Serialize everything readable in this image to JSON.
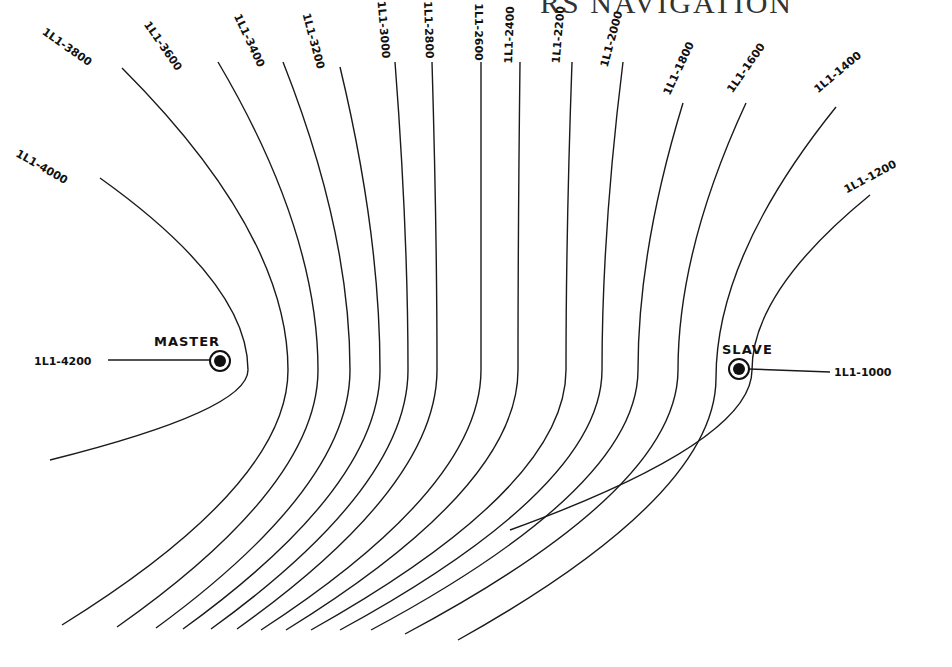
{
  "header": {
    "title": "RS NAVIGATION"
  },
  "stations": {
    "master": {
      "name": "MASTER",
      "line_label": "1L1-4200"
    },
    "slave": {
      "name": "SLAVE",
      "line_label": "1L1-1000"
    }
  },
  "lines_of_position": [
    {
      "label": "1L1-4000"
    },
    {
      "label": "1L1-3800"
    },
    {
      "label": "1L1-3600"
    },
    {
      "label": "1L1-3400"
    },
    {
      "label": "1L1-3200"
    },
    {
      "label": "1L1-3000"
    },
    {
      "label": "1L1-2800"
    },
    {
      "label": "1L1-2600"
    },
    {
      "label": "1L1-2400"
    },
    {
      "label": "1L1-2200"
    },
    {
      "label": "1L1-2000"
    },
    {
      "label": "1L1-1800"
    },
    {
      "label": "1L1-1600"
    },
    {
      "label": "1L1-1400"
    },
    {
      "label": "1L1-1200"
    }
  ],
  "colors": {
    "ink": "#1a1a1a",
    "paper": "#ffffff"
  }
}
